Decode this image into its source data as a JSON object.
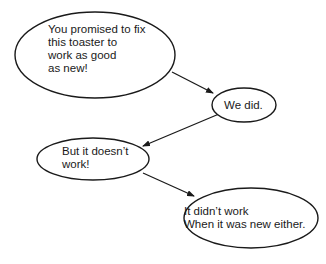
{
  "diagram": {
    "type": "dialogue-flow",
    "nodes": [
      {
        "id": "n1",
        "lines": [
          "You promised to fix",
          "this toaster to",
          "work as good",
          "as new!"
        ],
        "cx": 95,
        "cy": 55,
        "rx": 80,
        "ry": 43,
        "text_x": 48,
        "text_y": 33
      },
      {
        "id": "n2",
        "lines": [
          "We did."
        ],
        "cx": 244,
        "cy": 105,
        "rx": 32,
        "ry": 17,
        "text_x": 224,
        "text_y": 109
      },
      {
        "id": "n3",
        "lines": [
          "But it doesn’t",
          "work!"
        ],
        "cx": 93,
        "cy": 159,
        "rx": 56,
        "ry": 21,
        "text_x": 62,
        "text_y": 155
      },
      {
        "id": "n4",
        "lines": [
          "It didn’t work",
          "When it was new either."
        ],
        "cx": 251,
        "cy": 218,
        "rx": 67,
        "ry": 30,
        "text_x": 184,
        "text_y": 215
      }
    ],
    "edges": [
      {
        "from": "n1",
        "to": "n2",
        "x1": 172,
        "y1": 72,
        "x2": 213,
        "y2": 93
      },
      {
        "from": "n2",
        "to": "n3",
        "x1": 219,
        "y1": 114,
        "x2": 143,
        "y2": 146
      },
      {
        "from": "n3",
        "to": "n4",
        "x1": 143,
        "y1": 173,
        "x2": 194,
        "y2": 196
      }
    ],
    "colors": {
      "stroke": "#1a1a1a",
      "fill": "#ffffff",
      "text": "#1a1a1a"
    }
  }
}
